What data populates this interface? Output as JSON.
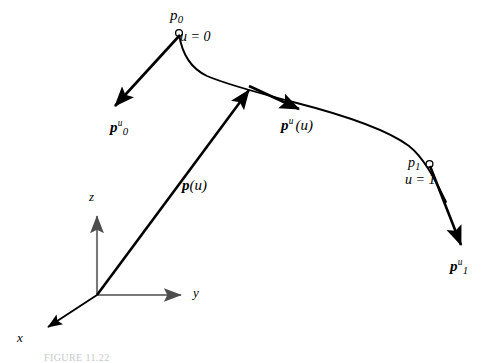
{
  "figure": {
    "type": "parametric-curve-diagram",
    "background_color": "#ffffff",
    "curve_color": "#000000",
    "axis_color": "#808080",
    "vector_color": "#000000",
    "width": 489,
    "height": 363
  },
  "curve": {
    "name": "p(u)",
    "start_marker": "open-circle",
    "end_marker": "open-circle",
    "start_point": {
      "x": 179,
      "y": 33
    },
    "end_point": {
      "x": 429,
      "y": 164
    },
    "interior_point": {
      "x": 251,
      "y": 88
    }
  },
  "labels": {
    "p0": "p",
    "p0_sub": "0",
    "p0_param": "u = 0",
    "p1": "p",
    "p1_sub": "1",
    "p1_param": "u = 1",
    "p0_tangent": "p",
    "p0_tangent_sub": "0",
    "p0_tangent_sup": "u",
    "p1_tangent": "p",
    "p1_tangent_sub": "1",
    "p1_tangent_sup": "u",
    "p_of_u": "p",
    "p_of_u_arg": "(u)",
    "pu_tangent": "p",
    "pu_tangent_sup": "u",
    "pu_tangent_arg": "(u)"
  },
  "axes": {
    "origin": {
      "x": 97,
      "y": 295
    },
    "x_label": "x",
    "y_label": "y",
    "z_label": "z",
    "x_tip": {
      "x": 43,
      "y": 331
    },
    "y_tip": {
      "x": 186,
      "y": 295
    },
    "z_tip": {
      "x": 97,
      "y": 211
    }
  },
  "vectors": [
    {
      "name": "p0-tangent-vector",
      "from": {
        "x": 179,
        "y": 34
      },
      "to": {
        "x": 112,
        "y": 109
      },
      "label": "p0u"
    },
    {
      "name": "position-vector-p-of-u",
      "from": {
        "x": 97,
        "y": 295
      },
      "to": {
        "x": 252,
        "y": 87
      },
      "label": "p(u)"
    },
    {
      "name": "pu-tangent-vector",
      "from": {
        "x": 249,
        "y": 86
      },
      "to": {
        "x": 303,
        "y": 111
      },
      "label": "pu(u)"
    },
    {
      "name": "p1-tangent-vector",
      "from": {
        "x": 430,
        "y": 165
      },
      "to": {
        "x": 464,
        "y": 251
      },
      "label": "p1u"
    }
  ],
  "caption": {
    "fragment": "FIGURE 11.22"
  }
}
